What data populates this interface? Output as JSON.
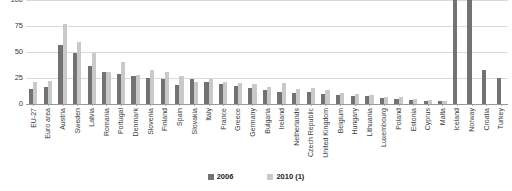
{
  "chart_data": {
    "type": "bar",
    "title": "",
    "xlabel": "",
    "ylabel": "",
    "ylim": [
      0,
      100
    ],
    "yticks": [
      0,
      25,
      50,
      75,
      100
    ],
    "ytick_labels": [
      "0",
      "25",
      "50",
      "75",
      "100"
    ],
    "grid": true,
    "legend_position": "bottom-center",
    "colors": {
      "2006": "#767171",
      "2010 (1)": "#c9c9c9",
      "gridline": "#d9d9d9",
      "axis": "#9a9a9a",
      "text": "#3b3b3b"
    },
    "categories": [
      "EU-27",
      "Euro area",
      "Austria",
      "Sweden",
      "Latvia",
      "Romania",
      "Portugal",
      "Denmark",
      "Slovenia",
      "Finland",
      "Spain",
      "Slovakia",
      "Italy",
      "France",
      "Greece",
      "Germany",
      "Bulgaria",
      "Ireland",
      "Netherlands",
      "Czech Republic",
      "United Kingdom",
      "Belgium",
      "Hungary",
      "Lithuania",
      "Luxembourg",
      "Poland",
      "Estonia",
      "Cyprus",
      "Malta",
      "Iceland",
      "Norway",
      "Croatia",
      "Turkey"
    ],
    "series": [
      {
        "name": "2006",
        "color": "#767171",
        "values": [
          14,
          16,
          57,
          49,
          37,
          31,
          29,
          27,
          25,
          24,
          18,
          24,
          21,
          19,
          17,
          15,
          13,
          12,
          11,
          12,
          10,
          9,
          8,
          8,
          6,
          5,
          4,
          3,
          3,
          100,
          100,
          33,
          25
        ]
      },
      {
        "name": "2010 (1)",
        "color": "#c9c9c9",
        "values": [
          21,
          22,
          77,
          60,
          49,
          31,
          40,
          28,
          33,
          31,
          27,
          21,
          24,
          21,
          20,
          19,
          16,
          20,
          14,
          15,
          13,
          11,
          10,
          9,
          7,
          7,
          5,
          4,
          3,
          null,
          null,
          null,
          null
        ]
      }
    ],
    "legend": [
      {
        "label": "2006",
        "color": "#767171"
      },
      {
        "label": "2010 (1)",
        "color": "#c9c9c9"
      }
    ]
  }
}
